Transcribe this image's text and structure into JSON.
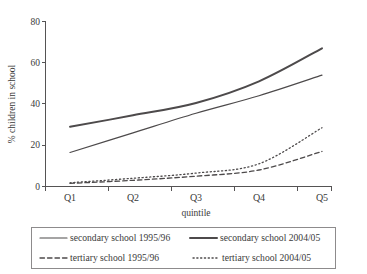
{
  "chart_data": {
    "type": "line",
    "title": "",
    "xlabel": "quintile",
    "ylabel": "% children in school",
    "categories": [
      "Q1",
      "Q2",
      "Q3",
      "Q4",
      "Q5"
    ],
    "x_tick_labels": [
      "Q1",
      "Q2",
      "Q3",
      "Q4",
      "Q5"
    ],
    "y_tick_labels": [
      "0",
      "20",
      "40",
      "60",
      "80"
    ],
    "y_ticks": [
      0,
      20,
      40,
      60,
      80
    ],
    "ylim": [
      0,
      80
    ],
    "grid": false,
    "legend_position": "bottom",
    "series": [
      {
        "name": "secondary school 1995/96",
        "style": "solid",
        "width": 1.2,
        "color": "#4d4a4b",
        "values": [
          16.5,
          26.0,
          35.5,
          44.0,
          54.0
        ]
      },
      {
        "name": "secondary school 2004/05",
        "style": "solid",
        "width": 2.0,
        "color": "#4d4a4b",
        "values": [
          29.0,
          34.5,
          40.5,
          51.0,
          67.0
        ]
      },
      {
        "name": "tertiary school 1995/96",
        "style": "dashed",
        "width": 1.3,
        "color": "#4d4a4b",
        "values": [
          1.5,
          3.0,
          5.0,
          8.0,
          17.0
        ]
      },
      {
        "name": "tertiary school 2004/05",
        "style": "dotted",
        "width": 1.3,
        "color": "#4d4a4b",
        "values": [
          1.8,
          4.0,
          6.5,
          11.0,
          28.5
        ]
      }
    ]
  },
  "legend": {
    "entries": [
      {
        "label": "secondary school 1995/96",
        "style": "solid-thin"
      },
      {
        "label": "secondary school 2004/05",
        "style": "solid-thick"
      },
      {
        "label": "tertiary school 1995/96",
        "style": "dashed"
      },
      {
        "label": "tertiary school 2004/05",
        "style": "dotted"
      }
    ]
  },
  "colors": {
    "line": "#4d4a4b",
    "axis": "#555354",
    "text": "#3a3a3a",
    "legend_border": "#8d8b8c",
    "background": "#ffffff"
  }
}
